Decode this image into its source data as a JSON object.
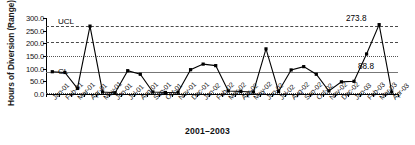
{
  "chart_data": {
    "type": "line",
    "title": "",
    "xlabel": "2001–2003",
    "ylabel": "Hours of Diversion (Range)",
    "ylim": [
      0,
      300
    ],
    "yticks": [
      "0.0",
      "50.0",
      "100.0",
      "150.0",
      "200.0",
      "250.0",
      "300.0"
    ],
    "ytick_values": [
      0,
      50,
      100,
      150,
      200,
      250,
      300
    ],
    "grid": true,
    "legend": "none",
    "categories": [
      "Jan-01",
      "Feb-01",
      "Mar-01",
      "Apr-01",
      "May-01",
      "Jun-01",
      "Jul-01",
      "Aug-01",
      "Sep-01",
      "Oct-01",
      "Nov-01",
      "Dec-01",
      "Jan-02",
      "Feb-02",
      "Mar-02",
      "Apr-02",
      "May-02",
      "Jun-02",
      "Jul-02",
      "Aug-02",
      "Sep-02",
      "Oct-02",
      "Nov-02",
      "Dec-02",
      "Jan-03",
      "Feb-03",
      "Mar-03",
      "Apr-03"
    ],
    "series": [
      {
        "name": "Hours of Diversion",
        "values": [
          88,
          85,
          22,
          268,
          8,
          5,
          92,
          78,
          8,
          6,
          7,
          96,
          118,
          112,
          12,
          10,
          8,
          178,
          10,
          95,
          108,
          78,
          12,
          48,
          50,
          158,
          273.8,
          8
        ]
      }
    ],
    "control_lines": [
      {
        "name": "UCL",
        "label": "UCL",
        "value": 270,
        "style": "dashed"
      },
      {
        "name": "upper-sigma-2",
        "label": "",
        "value": 205,
        "style": "dashed"
      },
      {
        "name": "upper-sigma-1",
        "label": "",
        "value": 152,
        "style": "dotted"
      },
      {
        "name": "CL",
        "label": "CL",
        "value": 88.8,
        "style": "solid"
      },
      {
        "name": "LCL",
        "label": "",
        "value": 6,
        "style": "dotted"
      }
    ],
    "annotations": [
      {
        "name": "peak-value",
        "text": "273.8",
        "x": "Mar-03",
        "y": 273.8
      },
      {
        "name": "center-line-value",
        "text": "88.8",
        "x": "Apr-03",
        "y": 88.8
      },
      {
        "name": "ucl-label",
        "text": "UCL"
      },
      {
        "name": "cl-label",
        "text": "CL"
      }
    ]
  }
}
